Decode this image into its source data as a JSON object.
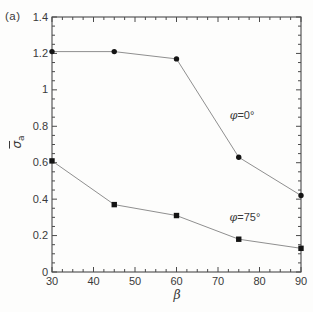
{
  "chart_data": {
    "type": "line",
    "panel_label": "(a)",
    "xlabel": "β",
    "ylabel": {
      "base": "σ",
      "subscript": "a",
      "overline": true
    },
    "xlim": [
      30,
      90
    ],
    "ylim": [
      0,
      1.4
    ],
    "xticks": [
      30,
      40,
      50,
      60,
      70,
      80,
      90
    ],
    "yticks": [
      0,
      0.2,
      0.4,
      0.6,
      0.8,
      1,
      1.2,
      1.4
    ],
    "ytick_labels": [
      "0",
      "0.2",
      "0.4",
      "0.6",
      "0.8",
      "1",
      "1.2",
      "1.4"
    ],
    "x_minor_step": 2.5,
    "y_minor_step": 0.05,
    "grid": false,
    "legend_position": "inline-annotations",
    "series": [
      {
        "name": "φ=0°",
        "marker": "circle",
        "x": [
          30,
          45,
          60,
          75,
          90
        ],
        "y": [
          1.21,
          1.21,
          1.17,
          0.63,
          0.42
        ],
        "annotation": {
          "symbol": "φ",
          "text": "=0°",
          "at": [
            75.8,
            0.86
          ]
        }
      },
      {
        "name": "φ=75°",
        "marker": "square",
        "x": [
          30,
          45,
          60,
          75,
          90
        ],
        "y": [
          0.61,
          0.37,
          0.31,
          0.18,
          0.13
        ],
        "annotation": {
          "symbol": "φ",
          "text": "=75°",
          "at": [
            76.5,
            0.3
          ]
        }
      }
    ],
    "colors": {
      "line": "#8f8f8f",
      "marker": "#141414",
      "axis": "#4a4a4a",
      "text": "#3a3a3a"
    }
  }
}
